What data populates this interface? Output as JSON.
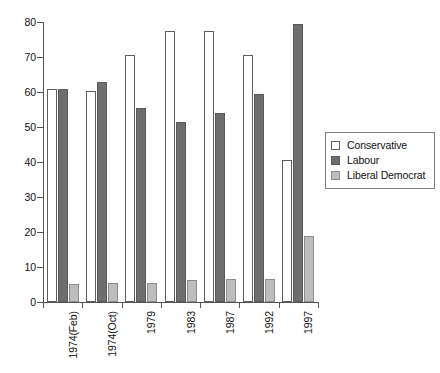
{
  "chart_data": {
    "type": "bar",
    "title": "",
    "subtitle": "",
    "xlabel": "",
    "ylabel": "",
    "ylim": [
      0,
      80
    ],
    "ytick_values": [
      0,
      10,
      20,
      30,
      40,
      50,
      60,
      70,
      80
    ],
    "ytick_labels": [
      "0",
      "10",
      "20",
      "30",
      "40",
      "50",
      "60",
      "70",
      "80"
    ],
    "grid": false,
    "legend_position": "right",
    "orientation": "vertical",
    "grouping": "grouped",
    "categories": [
      "1974(Feb)",
      "1974(Oct)",
      "1979",
      "1983",
      "1987",
      "1992",
      "1997"
    ],
    "series": [
      {
        "name": "Conservative",
        "color": "#ffffff",
        "edge_color": "#5e5e5e",
        "values": [
          61,
          60.3,
          70.5,
          77.5,
          77.5,
          70.5,
          40.5
        ]
      },
      {
        "name": "Labour",
        "color": "#6e6e6e",
        "edge_color": "#5a5a5a",
        "values": [
          61,
          63,
          55.3,
          51.3,
          54,
          59.5,
          79.5
        ]
      },
      {
        "name": "Liberal Democrat",
        "color": "#bdbdbd",
        "edge_color": "#8d8d8d",
        "values": [
          5.2,
          5.3,
          5.3,
          6.3,
          6.5,
          6.5,
          19
        ]
      }
    ]
  },
  "legend": {
    "entries": [
      {
        "label": "Conservative",
        "swatch": "conservative"
      },
      {
        "label": "Labour",
        "swatch": "labour"
      },
      {
        "label": "Liberal Democrat",
        "swatch": "libdem"
      }
    ]
  },
  "axes": {
    "y_axis_name": "y-axis",
    "x_axis_name": "x-axis"
  }
}
